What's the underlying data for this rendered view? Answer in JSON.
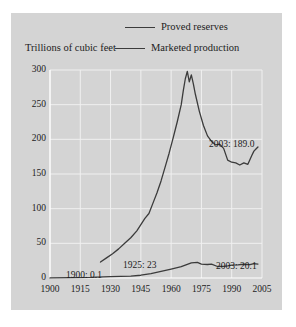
{
  "figure": {
    "background": "#ffffff",
    "panel_color": "#d4d4d4",
    "grid_color": "#f0f0f0",
    "line_color": "#3b3b3b",
    "text_color": "#1c1c1c"
  },
  "ylabel": "Trillions of cubic feet",
  "legend": [
    {
      "label": "Proved reserves",
      "key": "proved_reserves"
    },
    {
      "label": "Marketed production",
      "key": "marketed_production"
    }
  ],
  "annotations": [
    {
      "id": "ann-1900",
      "text": "1900: 0.1",
      "x": 55,
      "y": 258
    },
    {
      "id": "ann-1925",
      "text": "1925: 23",
      "x": 112,
      "y": 248
    },
    {
      "id": "ann-2003-reserves",
      "text": "2003: 189.0",
      "x": 198,
      "y": 127
    },
    {
      "id": "ann-2003-production",
      "text": "2003: 20.1",
      "x": 205,
      "y": 249
    }
  ],
  "chart_data": {
    "type": "line",
    "title": "",
    "subtitle": "",
    "xlabel": "",
    "ylabel": "Trillions of cubic feet",
    "xlim": [
      1900,
      2005
    ],
    "ylim": [
      0,
      300
    ],
    "xticks": [
      1900,
      1915,
      1930,
      1945,
      1960,
      1975,
      1990,
      2005
    ],
    "yticks": [
      0,
      50,
      100,
      150,
      200,
      250,
      300
    ],
    "grid": true,
    "legend_position": "top",
    "series": [
      {
        "name": "Proved reserves",
        "color": "#3b3b3b",
        "x": [
          1925,
          1928,
          1931,
          1934,
          1937,
          1940,
          1943,
          1945,
          1947,
          1949,
          1951,
          1953,
          1955,
          1957,
          1959,
          1961,
          1963,
          1965,
          1966,
          1967,
          1968,
          1969,
          1970,
          1971,
          1972,
          1974,
          1976,
          1978,
          1980,
          1982,
          1984,
          1986,
          1988,
          1990,
          1992,
          1994,
          1996,
          1998,
          2000,
          2001,
          2002,
          2003
        ],
        "values": [
          23,
          29,
          35,
          42,
          50,
          58,
          68,
          77,
          86,
          93,
          108,
          123,
          140,
          160,
          180,
          202,
          225,
          250,
          270,
          287,
          298,
          283,
          293,
          280,
          265,
          240,
          220,
          205,
          197,
          192,
          193,
          187,
          170,
          167,
          166,
          163,
          166,
          164,
          177,
          183,
          186,
          189
        ]
      },
      {
        "name": "Marketed production",
        "color": "#3b3b3b",
        "x": [
          1900,
          1910,
          1920,
          1930,
          1940,
          1945,
          1950,
          1955,
          1960,
          1965,
          1970,
          1973,
          1975,
          1978,
          1980,
          1983,
          1986,
          1988,
          1990,
          1993,
          1996,
          1999,
          2001,
          2003
        ],
        "values": [
          0.1,
          0.5,
          0.8,
          2.0,
          2.7,
          4.0,
          6.3,
          9.4,
          12.8,
          16.3,
          21.9,
          22.6,
          20.1,
          19.5,
          20.0,
          16.6,
          16.9,
          17.6,
          18.6,
          18.9,
          19.8,
          19.3,
          20.6,
          20.1
        ]
      }
    ]
  }
}
